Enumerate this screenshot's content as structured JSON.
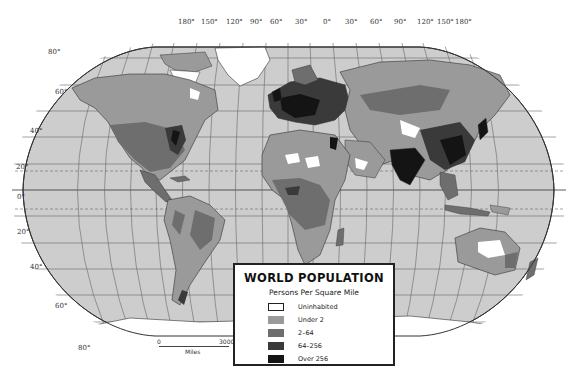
{
  "map": {
    "title": "WORLD POPULATION",
    "subtitle": "Persons Per Square Mile",
    "projection": "elliptical world projection with graticule",
    "colors": {
      "ocean": "#cdcdcd",
      "graticule": "#555555",
      "uninhabited": "#ffffff",
      "under_2": "#9a9a9a",
      "2_64": "#6e6e6e",
      "64_256": "#3a3a3a",
      "over_256": "#141414"
    }
  },
  "legend": {
    "title": "WORLD POPULATION",
    "subtitle": "Persons Per Square Mile",
    "items": [
      {
        "label": "Uninhabited",
        "color": "#ffffff"
      },
      {
        "label": "Under 2",
        "color": "#9a9a9a"
      },
      {
        "label": "2–64",
        "color": "#6e6e6e"
      },
      {
        "label": "64–256",
        "color": "#3a3a3a"
      },
      {
        "label": "Over 256",
        "color": "#141414"
      }
    ]
  },
  "longitude_labels": [
    "180°",
    "150°",
    "120°",
    "90°",
    "60°",
    "30°",
    "0°",
    "30°",
    "60°",
    "90°",
    "120°",
    "150°",
    "180°"
  ],
  "latitude_labels": [
    "80°",
    "60°",
    "40°",
    "20°",
    "0°",
    "20°",
    "40°",
    "60°",
    "80°"
  ],
  "scale_bar": {
    "start": "0",
    "end": "3000",
    "unit": "Miles"
  }
}
